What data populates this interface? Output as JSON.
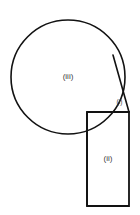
{
  "figure": {
    "title": "Diagram B",
    "background_color": "#ffffff",
    "stroke_color": "#121212",
    "label_color": "#3c3c3c",
    "width": 140,
    "height": 215
  },
  "shapes": {
    "circle": {
      "name": "circle",
      "label": "(iii)",
      "center_x": 68,
      "center_y": 77,
      "radius": 57,
      "stroke_width": 1.6,
      "label_x": 68,
      "label_y": 77,
      "label_size": 8
    },
    "rectangle": {
      "name": "rectangle",
      "label": "(ii)",
      "left": 87,
      "top": 112,
      "right": 129,
      "bottom": 206,
      "stroke_width": 1.8,
      "label_x": 108,
      "label_y": 159,
      "label_size": 8
    },
    "cusp_region": {
      "name": "curvilinear-triangle",
      "label": "(i)",
      "tangent_start_x": 113,
      "tangent_start_y": 55,
      "tangent_end_x": 129,
      "tangent_end_y": 112,
      "stroke_width": 1.5,
      "label_x": 119,
      "label_y": 102,
      "label_size": 6.5
    }
  },
  "paths": {
    "circle_outline": "M 68 20 A 57 57 0 1 1 67.9 20",
    "tangent_line": "M 113 55 L 129 112",
    "cusp_fill": "M 113 55 L 129 112 L 124.6 112 A 57 57 0 0 0 113 55 Z",
    "rectangle_outline": "M 87 112 L 129 112 L 129 206 L 87 206 Z",
    "rectangle_top_left_segment": "M 87 112 L 103 112"
  },
  "labels": {
    "region_i": "(i)",
    "region_ii": "(ii)",
    "region_iii": "(iii)"
  }
}
